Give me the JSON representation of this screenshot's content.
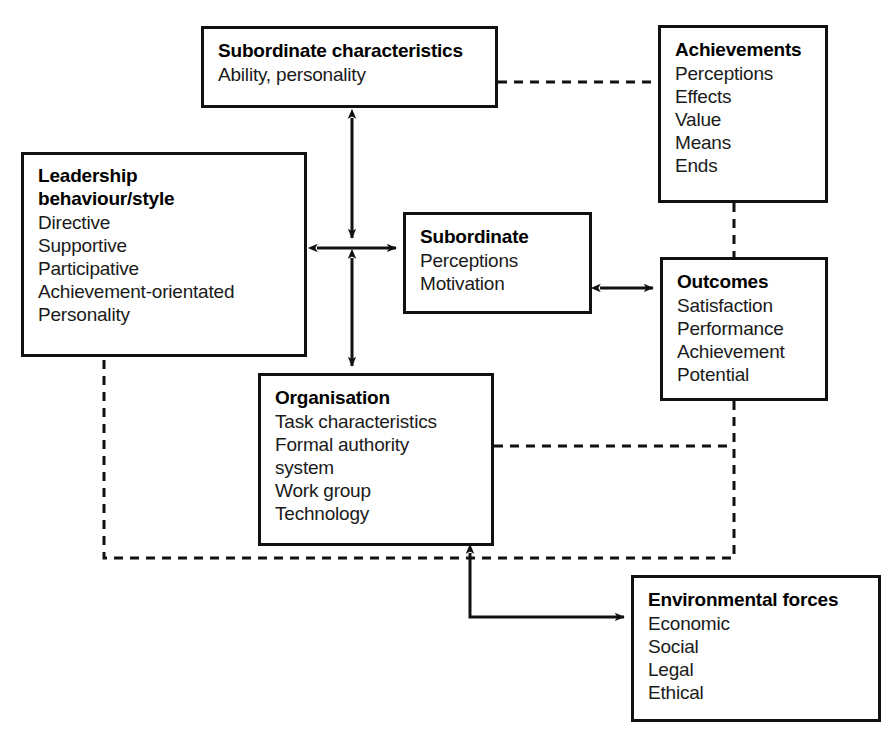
{
  "diagram": {
    "type": "flow-diagram",
    "stroke_color": "#111111",
    "background_color": "#ffffff",
    "nodes": [
      {
        "id": "subordinate-characteristics",
        "title": "Subordinate characteristics",
        "items": [
          "Ability, personality"
        ]
      },
      {
        "id": "achievements",
        "title": "Achievements",
        "items": [
          "Perceptions",
          "Effects",
          "Value",
          "Means",
          "Ends"
        ]
      },
      {
        "id": "leadership",
        "title_line1": "Leadership",
        "title_line2": "behaviour/style",
        "items": [
          "Directive",
          "Supportive",
          "Participative",
          "Achievement-orientated",
          "Personality"
        ]
      },
      {
        "id": "subordinate",
        "title": "Subordinate",
        "items": [
          "Perceptions",
          "Motivation"
        ]
      },
      {
        "id": "outcomes",
        "title": "Outcomes",
        "items": [
          "Satisfaction",
          "Performance",
          "Achievement",
          "Potential"
        ]
      },
      {
        "id": "organisation",
        "title": "Organisation",
        "items": [
          "Task characteristics",
          "Formal authority",
          "system",
          "Work group",
          "Technology"
        ]
      },
      {
        "id": "environmental",
        "title": "Environmental forces",
        "items": [
          "Economic",
          "Social",
          "Legal",
          "Ethical"
        ]
      }
    ],
    "connectors": [
      {
        "id": "subordinate-characteristics-to-subordinate",
        "style": "solid",
        "arrows": "both",
        "orientation": "vertical"
      },
      {
        "id": "leadership-to-subordinate",
        "style": "solid",
        "arrows": "both",
        "orientation": "horizontal"
      },
      {
        "id": "subordinate-to-organisation",
        "style": "solid",
        "arrows": "both",
        "orientation": "vertical"
      },
      {
        "id": "subordinate-to-outcomes",
        "style": "solid",
        "arrows": "both",
        "orientation": "horizontal"
      },
      {
        "id": "subordinate-characteristics-to-achievements",
        "style": "dashed",
        "arrows": "none",
        "orientation": "horizontal"
      },
      {
        "id": "achievements-to-outcomes",
        "style": "dashed",
        "arrows": "none",
        "orientation": "vertical"
      },
      {
        "id": "organisation-to-outcomes-feedback",
        "style": "dashed",
        "arrows": "none",
        "orientation": "horizontal"
      },
      {
        "id": "outcomes-to-leadership-feedback",
        "style": "dashed",
        "arrows": "none",
        "orientation": "path"
      },
      {
        "id": "environmental-to-organisation",
        "style": "solid",
        "arrows": "both-ends",
        "orientation": "path"
      }
    ]
  }
}
